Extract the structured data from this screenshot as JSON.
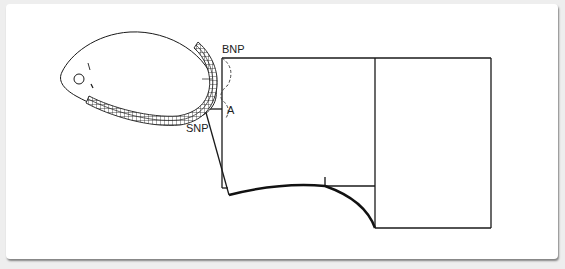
{
  "diagram": {
    "type": "pattern-drafting",
    "labels": {
      "bnp": "BNP",
      "snp": "SNP",
      "a": "A"
    },
    "colors": {
      "line": "#1a1a1a",
      "background": "#ffffff",
      "page": "#eeeeee"
    }
  }
}
